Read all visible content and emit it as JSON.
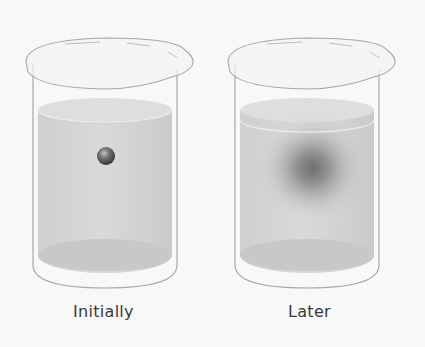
{
  "figure": {
    "panels": [
      {
        "label": "Initially",
        "state": "solute-sphere-concentrated"
      },
      {
        "label": "Later",
        "state": "solute-diffused-cloud"
      }
    ],
    "colors": {
      "background": "#f8f8f8",
      "liquid": "#d4d4d4",
      "glass_outline": "#a8a8a8",
      "sphere": "#555555",
      "label_text": "#3a3a3a"
    }
  }
}
